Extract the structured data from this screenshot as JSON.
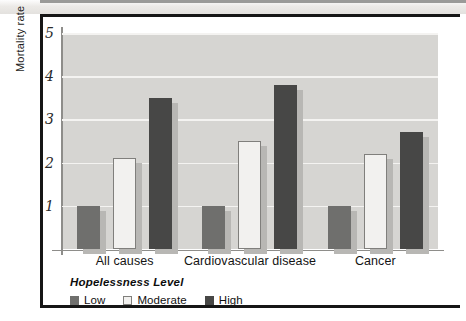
{
  "figure": {
    "y_axis_title": "Mortality rate",
    "y_ticks": [
      "5",
      "4",
      "3",
      "2",
      "1"
    ],
    "legend_title": "Hopelessness Level"
  },
  "colors": {
    "plot_background": "#d6d5d2",
    "gridline": "#f4f3f1",
    "low": "#6f6f6d",
    "moderate": "#f2f1ef",
    "moderate_outline": "#807f7c",
    "high": "#474746",
    "shadow": "#b8b7b4",
    "frame": "#161616"
  },
  "chart_data": {
    "type": "bar",
    "title": "",
    "xlabel": "",
    "ylabel": "Mortality rate",
    "ylim": [
      0,
      5
    ],
    "yticks": [
      1,
      2,
      3,
      4,
      5
    ],
    "grid": true,
    "legend_title": "Hopelessness Level",
    "legend_position": "below-axes-left",
    "categories": [
      "All causes",
      "Cardiovascular disease",
      "Cancer"
    ],
    "series": [
      {
        "name": "Low",
        "values": [
          1.0,
          1.0,
          1.0
        ]
      },
      {
        "name": "Moderate",
        "values": [
          2.1,
          2.5,
          2.2
        ]
      },
      {
        "name": "High",
        "values": [
          3.5,
          3.8,
          2.7
        ]
      }
    ]
  }
}
